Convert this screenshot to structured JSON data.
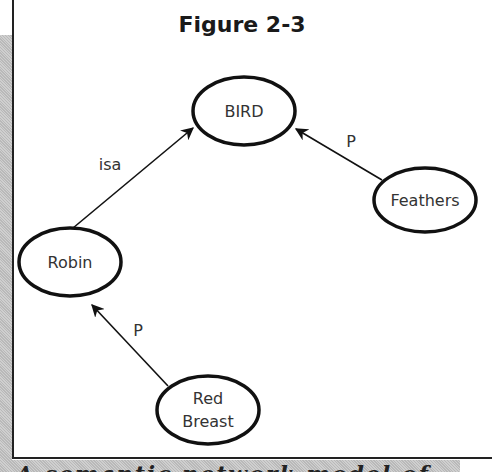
{
  "figure": {
    "title": "Figure 2-3",
    "caption_partial": "A semantic network model of ..."
  },
  "nodes": [
    {
      "id": "bird",
      "label": "BIRD",
      "cx": 244,
      "cy": 111,
      "rx": 51,
      "ry": 34
    },
    {
      "id": "robin",
      "label": "Robin",
      "cx": 70,
      "cy": 262,
      "rx": 51,
      "ry": 34
    },
    {
      "id": "feathers",
      "label": "Feathers",
      "cx": 425,
      "cy": 200,
      "rx": 51,
      "ry": 32
    },
    {
      "id": "red-breast",
      "label_line1": "Red",
      "label_line2": "Breast",
      "cx": 208,
      "cy": 410,
      "rx": 51,
      "ry": 34
    }
  ],
  "edges": [
    {
      "from": "robin",
      "to": "bird",
      "label": "isa"
    },
    {
      "from": "feathers",
      "to": "bird",
      "label": "P"
    },
    {
      "from": "red-breast",
      "to": "robin",
      "label": "P"
    }
  ],
  "colors": {
    "stroke": "#111111",
    "text": "#333333",
    "shade": "#c4c4c4"
  }
}
